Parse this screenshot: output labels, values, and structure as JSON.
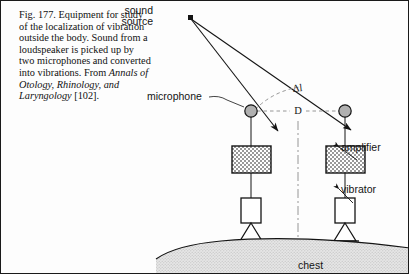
{
  "figure": {
    "caption": {
      "lead": "Fig. 177. Equipment for study of the localization of vibration outside the body. Sound from a loudspeaker is picked up by two microphones and converted into vibrations. From ",
      "journal_italic": "Annals of Otology, Rhinology, and Laryngology",
      "tail": " [102]."
    },
    "labels": {
      "sound_source_line1": "sound",
      "sound_source_line2": "source",
      "microphone": "microphone",
      "amplifier": "amplifier",
      "vibrator": "vibrator",
      "chest": "chest",
      "path_difference": "Δl",
      "separation": "D"
    },
    "colors": {
      "ink": "#141414",
      "hatch": "#6d6d6d",
      "mic_fill": "#b0b0b0",
      "chest_fill": "#d9d9d9",
      "paper": "#fdfdfd"
    }
  }
}
